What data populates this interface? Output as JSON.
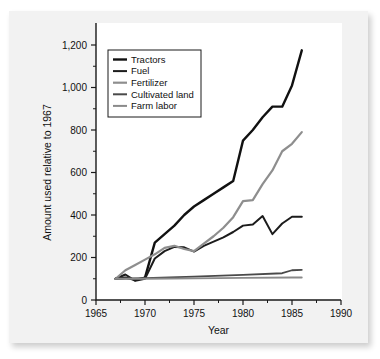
{
  "chart_data": {
    "type": "line",
    "title": "",
    "xlabel": "Year",
    "ylabel": "Amount used relative to 1967",
    "xlim": [
      1965,
      1990
    ],
    "ylim": [
      0,
      1200
    ],
    "xticks": [
      1965,
      1970,
      1975,
      1980,
      1985,
      1990
    ],
    "xticklabels": [
      "1965",
      "1970",
      "1975",
      "1980",
      "1985",
      "1990"
    ],
    "yticks": [
      0,
      200,
      400,
      600,
      800,
      1000,
      1200
    ],
    "yticklabels": [
      "0",
      "200",
      "400",
      "600",
      "800",
      "1,000",
      "1,200"
    ],
    "grid": false,
    "legend_position": "upper left",
    "series": [
      {
        "name": "Tractors",
        "color": "#111111",
        "width": 2.4,
        "x": [
          1967,
          1968,
          1969,
          1970,
          1971,
          1972,
          1973,
          1974,
          1975,
          1976,
          1977,
          1978,
          1979,
          1980,
          1981,
          1982,
          1983,
          1984,
          1985,
          1986
        ],
        "y": [
          100,
          105,
          95,
          105,
          270,
          310,
          350,
          400,
          440,
          470,
          500,
          530,
          560,
          750,
          800,
          860,
          910,
          910,
          1010,
          1175
        ]
      },
      {
        "name": "Fuel",
        "color": "#1c1c1c",
        "width": 2.0,
        "x": [
          1967,
          1968,
          1969,
          1970,
          1971,
          1972,
          1973,
          1974,
          1975,
          1976,
          1977,
          1978,
          1979,
          1980,
          1981,
          1982,
          1983,
          1984,
          1985,
          1986
        ],
        "y": [
          100,
          120,
          90,
          100,
          195,
          230,
          250,
          248,
          228,
          255,
          275,
          295,
          320,
          350,
          355,
          395,
          310,
          360,
          392,
          392
        ]
      },
      {
        "name": "Fertilizer",
        "color": "#8e8e8e",
        "width": 2.2,
        "x": [
          1967,
          1968,
          1969,
          1970,
          1971,
          1972,
          1973,
          1974,
          1975,
          1976,
          1977,
          1978,
          1979,
          1980,
          1981,
          1982,
          1983,
          1984,
          1985,
          1986
        ],
        "y": [
          100,
          140,
          165,
          190,
          215,
          245,
          255,
          240,
          230,
          265,
          300,
          340,
          390,
          465,
          470,
          545,
          610,
          700,
          735,
          790
        ]
      },
      {
        "name": "Cultivated land",
        "color": "#4a4a4a",
        "width": 1.8,
        "x": [
          1967,
          1970,
          1975,
          1980,
          1984,
          1985,
          1986
        ],
        "y": [
          100,
          103,
          110,
          118,
          126,
          140,
          142
        ]
      },
      {
        "name": "Farm labor",
        "color": "#8a8a8a",
        "width": 1.8,
        "x": [
          1967,
          1970,
          1975,
          1980,
          1985,
          1986
        ],
        "y": [
          100,
          100,
          102,
          104,
          106,
          106
        ]
      }
    ]
  },
  "legend": {
    "entries": [
      {
        "label": "Tractors"
      },
      {
        "label": "Fuel"
      },
      {
        "label": "Fertilizer"
      },
      {
        "label": "Cultivated land"
      },
      {
        "label": "Farm labor"
      }
    ]
  },
  "colors": {
    "page_background": "#ffffff",
    "card_background": "#f2f2f2",
    "plot_background": "#ffffff",
    "axis": "#1a1a1a",
    "text": "#111111"
  }
}
